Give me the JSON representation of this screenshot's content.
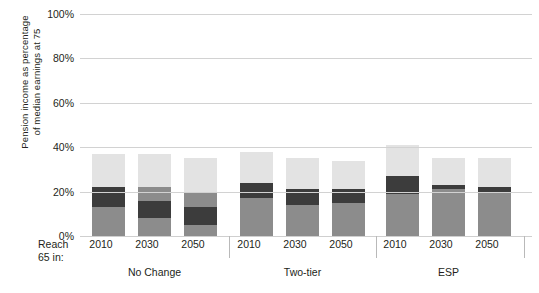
{
  "chart_data": {
    "type": "bar",
    "stacked": true,
    "title": "",
    "xlabel": "Reach 65 in:",
    "ylabel": "Pension income as percentage\nof median earnings at 75",
    "ylim": [
      0,
      100
    ],
    "ytick_labels": [
      "0%",
      "20%",
      "40%",
      "60%",
      "80%",
      "100%"
    ],
    "ytick_values": [
      0,
      20,
      40,
      60,
      80,
      100
    ],
    "grid": true,
    "legend": "none",
    "categories": [
      "2010",
      "2030",
      "2050",
      "2010",
      "2030",
      "2050",
      "2010",
      "2030",
      "2050"
    ],
    "groups": [
      {
        "label": "No Change",
        "categories": [
          "2010",
          "2030",
          "2050"
        ]
      },
      {
        "label": "Two-tier",
        "categories": [
          "2010",
          "2030",
          "2050"
        ]
      },
      {
        "label": "ESP",
        "categories": [
          "2010",
          "2030",
          "2050"
        ]
      }
    ],
    "series": [
      {
        "name": "segment-1-medium-gray",
        "color": "#8c8c8c",
        "values": [
          13,
          8,
          5,
          17,
          14,
          15,
          19,
          21,
          20
        ]
      },
      {
        "name": "segment-2-dark-gray",
        "color": "#3c3c3c",
        "values": [
          9,
          8,
          8,
          7,
          7,
          6,
          8,
          2,
          2
        ]
      },
      {
        "name": "segment-3-medium-gray",
        "color": "#8c8c8c",
        "values": [
          0,
          6,
          7,
          0,
          0,
          0,
          0,
          0,
          0
        ]
      },
      {
        "name": "segment-4-light-gray",
        "color": "#e3e3e3",
        "values": [
          15,
          15,
          15,
          14,
          14,
          13,
          14,
          12,
          13
        ]
      }
    ],
    "bar_totals": [
      37,
      37,
      35,
      38,
      35,
      34,
      41,
      35,
      35
    ],
    "colors": {
      "medium_gray": "#8c8c8c",
      "dark_gray": "#3c3c3c",
      "light_gray": "#e3e3e3",
      "gridline": "#d2d2d2",
      "text": "#231f20",
      "background": "#ffffff"
    }
  }
}
